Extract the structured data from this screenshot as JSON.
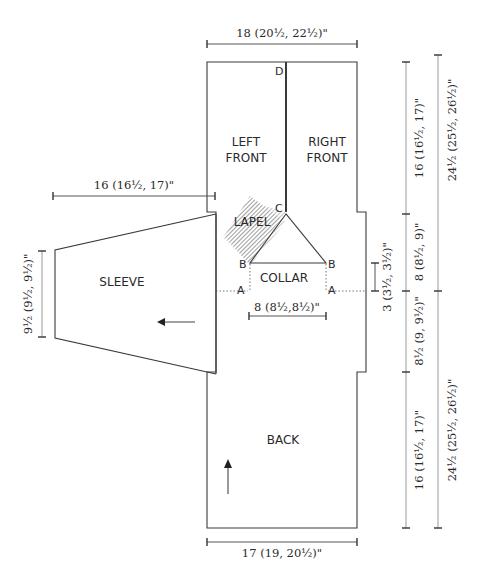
{
  "diagram": {
    "type": "knitting-schematic",
    "pieces": {
      "left_front": {
        "line1": "LEFT",
        "line2": "FRONT"
      },
      "right_front": {
        "line1": "RIGHT",
        "line2": "FRONT"
      },
      "lapel": "LAPEL",
      "collar": "COLLAR",
      "sleeve": "SLEEVE",
      "back": "BACK"
    },
    "points": {
      "a_left": "A",
      "a_right": "A",
      "b_left": "B",
      "b_right": "B",
      "c": "C",
      "d": "D"
    },
    "measurements": {
      "front_width": "18 (20½, 22½)\"",
      "sleeve_length": "16 (16½, 17)\"",
      "sleeve_cuff": "9½ (9½, 9½)\"",
      "collar_width": "8 (8½,8½)\"",
      "collar_depth": "3 (3½, 3½)\"",
      "front_length": "16 (16½, 17)\"",
      "front_armhole": "8 (8½, 9)\"",
      "front_total": "24½ (25½, 26½)\"",
      "back_armhole": "8½ (9, 9½)\"",
      "back_length": "16 (16½, 17)\"",
      "back_total": "24½ (25½, 26½)\"",
      "back_width": "17 (19, 20½)\""
    },
    "arrows": {
      "sleeve_direction": "left",
      "back_direction": "up"
    }
  }
}
